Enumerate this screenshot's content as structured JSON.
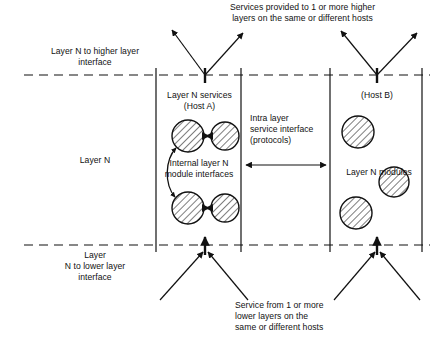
{
  "diagram": {
    "title_text": "Layer N service and interface model",
    "annotations": {
      "top_services": "Services provided to 1 or more higher\nlayers on the same or different hosts",
      "higher_interface": "Layer N to higher layer\ninterface",
      "layer_n": "Layer N",
      "lower_interface": "Layer\nN to lower layer\ninterface",
      "bottom_service": "Service from 1 or more\nlower layers on the\nsame or different hosts",
      "host_a": "Layer N services\n(Host A)",
      "host_b": "(Host B)",
      "internal_interfaces": "Internal layer N\nmodule interfaces",
      "intra_layer": "Intra layer\nservice interface\n(protocols)",
      "layer_n_modules": "Layer N modules"
    },
    "colors": {
      "stroke": "#111111",
      "background": "#ffffff",
      "hatch": "#111111"
    },
    "geometry": {
      "upper_dashed_y": 75,
      "lower_dashed_y": 245,
      "box_a_left": 156,
      "box_a_right": 241,
      "box_b_left": 330,
      "box_b_right": 422,
      "mid_divider_x": 300
    },
    "modules": {
      "host_a": [
        {
          "cx": 188,
          "cy": 136,
          "r": 16
        },
        {
          "cx": 225,
          "cy": 136,
          "r": 14
        },
        {
          "cx": 188,
          "cy": 208,
          "r": 16
        },
        {
          "cx": 225,
          "cy": 208,
          "r": 14
        }
      ],
      "host_b": [
        {
          "cx": 358,
          "cy": 132,
          "r": 16
        },
        {
          "cx": 394,
          "cy": 182,
          "r": 15
        },
        {
          "cx": 356,
          "cy": 213,
          "r": 16
        }
      ]
    },
    "arrows": {
      "top_left_pair": {
        "apex_x": 205,
        "apex_y": 75
      },
      "top_right_pair": {
        "apex_x": 377,
        "apex_y": 75
      },
      "bottom_left_pair": {
        "apex_x": 205,
        "apex_y": 245
      },
      "bottom_right_pair": {
        "apex_x": 377,
        "apex_y": 245
      },
      "intra_layer_double": {
        "y": 165,
        "x1": 244,
        "x2": 327
      }
    }
  }
}
